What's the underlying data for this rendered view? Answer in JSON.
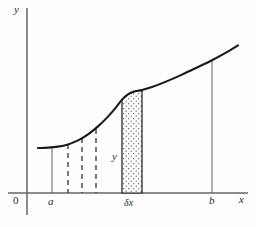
{
  "figure": {
    "background_color": "#fefefe",
    "width": 256,
    "height": 227
  },
  "axes": {
    "x_axis": {
      "label": "x",
      "color": "#666666",
      "y_pixel": 193,
      "x_start": 8,
      "x_end": 248
    },
    "y_axis": {
      "label": "y",
      "color": "#666666",
      "x_pixel": 27,
      "y_start": 8,
      "y_end": 215
    },
    "origin": {
      "label": "0"
    }
  },
  "ticks": [
    {
      "name": "lower-limit",
      "label": "a",
      "x": 52
    },
    {
      "name": "strip-position",
      "label": "δx",
      "x": 132
    },
    {
      "name": "upper-limit",
      "label": "b",
      "x": 212
    }
  ],
  "curve": {
    "name": "function-curve",
    "color": "#1a1a1a",
    "stroke_width": 2.1,
    "description": "y = f(x), flat near x=a then rising with an inflection",
    "points": [
      [
        38,
        148
      ],
      [
        48,
        147.6
      ],
      [
        58,
        146.6
      ],
      [
        68,
        144.4
      ],
      [
        78,
        140.4
      ],
      [
        88,
        134.4
      ],
      [
        98,
        126.4
      ],
      [
        108,
        116.6
      ],
      [
        116,
        107.4
      ],
      [
        122,
        99.6
      ],
      [
        128,
        94.4
      ],
      [
        134,
        91.6
      ],
      [
        142,
        90.0
      ],
      [
        152,
        87.0
      ],
      [
        166,
        81.6
      ],
      [
        182,
        74.6
      ],
      [
        198,
        67.0
      ],
      [
        212,
        60.2
      ],
      [
        226,
        52.6
      ],
      [
        238,
        45.4
      ]
    ]
  },
  "ordinates": {
    "solid": [
      {
        "name": "ordinate-at-a",
        "x": 52,
        "y_top": 147,
        "color": "#555555",
        "width": 0.9
      },
      {
        "name": "ordinate-at-b",
        "x": 212,
        "y_top": 60,
        "color": "#555555",
        "width": 0.9
      }
    ],
    "dashed": [
      {
        "name": "dashed-ordinate-1",
        "x": 68,
        "y_top": 144
      },
      {
        "name": "dashed-ordinate-2",
        "x": 82,
        "y_top": 138
      },
      {
        "name": "dashed-ordinate-3",
        "x": 96,
        "y_top": 129
      }
    ],
    "dash_color": "#333333",
    "dash_pattern": "5,4",
    "dash_width": 1.3
  },
  "strip": {
    "name": "elemental-strip",
    "x_left": 122,
    "x_right": 142,
    "y_top_left": 99.6,
    "y_top_right": 90.0,
    "y_bottom": 193,
    "fill_pattern": "stipple-dots",
    "dot_color": "#4a4a4a",
    "edge_color": "#1a1a1a",
    "edge_width": 1.2,
    "width_label": "δx",
    "height_label": "y"
  },
  "labels": {
    "height_label": {
      "text": "y",
      "x": 112,
      "y": 160
    },
    "y_axis_label": {
      "text": "y",
      "x": 14,
      "y": 13
    },
    "x_axis_label": {
      "text": "x",
      "x": 239,
      "y": 203
    },
    "origin": {
      "text": "0",
      "x": 13,
      "y": 204
    },
    "a": {
      "text": "a",
      "x": 48,
      "y": 205
    },
    "delta_x": {
      "text": "δx",
      "x": 124,
      "y": 206
    },
    "b": {
      "text": "b",
      "x": 209,
      "y": 204
    }
  }
}
